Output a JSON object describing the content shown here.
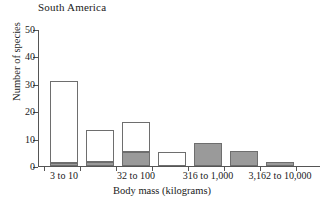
{
  "chart_data": {
    "type": "bar",
    "title": "South America",
    "xlabel": "Body mass (kilograms)",
    "ylabel": "Number of species",
    "ylim": [
      0,
      50
    ],
    "ytick_values": [
      0,
      10,
      20,
      30,
      40,
      50
    ],
    "grid": false,
    "legend": null,
    "stacked": true,
    "series": [
      {
        "name": "gray",
        "color": "#9a9a9a",
        "values": [
          1,
          1.5,
          5,
          0,
          8.5,
          5.5,
          1.5
        ]
      },
      {
        "name": "white",
        "color": "#ffffff",
        "values": [
          30,
          11.5,
          11,
          5,
          0,
          0,
          0
        ]
      }
    ],
    "totals": [
      31,
      13,
      16,
      5,
      8.5,
      5.5,
      1.5
    ],
    "categories": [
      "3 to 10",
      "",
      "32 to 100",
      "",
      "316 to 1,000",
      "",
      "3,162 to 10,000"
    ],
    "xtick_labels": [
      {
        "text": "3 to 10",
        "slot": 0
      },
      {
        "text": "32 to 100",
        "slot": 2
      },
      {
        "text": "316 to 1,000",
        "slot": 4
      },
      {
        "text": "3,162 to 10,000",
        "slot": 6
      }
    ]
  },
  "axis": {
    "y_labels": [
      "50",
      "40",
      "30",
      "20",
      "10",
      "0"
    ]
  }
}
